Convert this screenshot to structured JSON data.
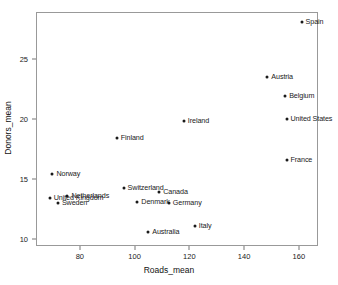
{
  "chart_data": {
    "type": "scatter",
    "title": "",
    "xlabel": "Roads_mean",
    "ylabel": "Donors_mean",
    "xlim": [
      64,
      167
    ],
    "ylim": [
      9.4,
      28.9
    ],
    "grid": false,
    "legend": "none",
    "xticks": [
      80,
      100,
      120,
      140,
      160
    ],
    "xtick_labels": [
      "80",
      "100",
      "120",
      "140",
      "160"
    ],
    "yticks": [
      10,
      15,
      20,
      25
    ],
    "ytick_labels": [
      "10",
      "15",
      "20",
      "25"
    ],
    "point_labels_shown": true,
    "points": [
      {
        "label": "Spain",
        "x": 161.0,
        "y": 28.1,
        "label_pos": "right"
      },
      {
        "label": "Austria",
        "x": 148.5,
        "y": 23.5,
        "label_pos": "right"
      },
      {
        "label": "Belgium",
        "x": 155.0,
        "y": 21.9,
        "label_pos": "right"
      },
      {
        "label": "United States",
        "x": 155.5,
        "y": 20.0,
        "label_pos": "right"
      },
      {
        "label": "Ireland",
        "x": 118.0,
        "y": 19.8,
        "label_pos": "right"
      },
      {
        "label": "Finland",
        "x": 93.5,
        "y": 18.4,
        "label_pos": "right"
      },
      {
        "label": "France",
        "x": 155.5,
        "y": 16.6,
        "label_pos": "right"
      },
      {
        "label": "Norway",
        "x": 70.0,
        "y": 15.4,
        "label_pos": "right"
      },
      {
        "label": "Switzerland",
        "x": 96.0,
        "y": 14.2,
        "label_pos": "right"
      },
      {
        "label": "Canada",
        "x": 109.0,
        "y": 13.9,
        "label_pos": "right"
      },
      {
        "label": "Netherlands",
        "x": 75.5,
        "y": 13.6,
        "label_pos": "right"
      },
      {
        "label": "United Kingdom",
        "x": 69.0,
        "y": 13.4,
        "label_pos": "right"
      },
      {
        "label": "Sweden",
        "x": 72.0,
        "y": 13.0,
        "label_pos": "right"
      },
      {
        "label": "Denmark",
        "x": 101.0,
        "y": 13.1,
        "label_pos": "right"
      },
      {
        "label": "Germany",
        "x": 112.5,
        "y": 13.0,
        "label_pos": "right"
      },
      {
        "label": "Italy",
        "x": 122.0,
        "y": 11.1,
        "label_pos": "right"
      },
      {
        "label": "Australia",
        "x": 105.0,
        "y": 10.6,
        "label_pos": "right"
      }
    ]
  }
}
